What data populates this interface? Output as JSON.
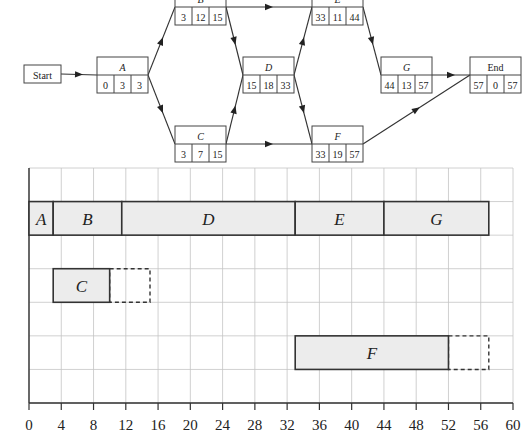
{
  "network": {
    "start_label": "Start",
    "nodes": [
      {
        "id": "A",
        "label": "A",
        "es": "0",
        "dur": "3",
        "ef": "3"
      },
      {
        "id": "B",
        "label": "B",
        "es": "3",
        "dur": "12",
        "ef": "15"
      },
      {
        "id": "C",
        "label": "C",
        "es": "3",
        "dur": "7",
        "ef": "15"
      },
      {
        "id": "D",
        "label": "D",
        "es": "15",
        "dur": "18",
        "ef": "33"
      },
      {
        "id": "E",
        "label": "E",
        "es": "33",
        "dur": "11",
        "ef": "44"
      },
      {
        "id": "F",
        "label": "F",
        "es": "33",
        "dur": "19",
        "ef": "57"
      },
      {
        "id": "G",
        "label": "G",
        "es": "44",
        "dur": "13",
        "ef": "57"
      },
      {
        "id": "End",
        "label": "End",
        "es": "57",
        "dur": "0",
        "ef": "57"
      }
    ],
    "edges": [
      [
        "Start",
        "A"
      ],
      [
        "A",
        "B"
      ],
      [
        "A",
        "C"
      ],
      [
        "B",
        "D"
      ],
      [
        "B",
        "E"
      ],
      [
        "C",
        "D"
      ],
      [
        "C",
        "F"
      ],
      [
        "D",
        "E"
      ],
      [
        "D",
        "F"
      ],
      [
        "E",
        "G"
      ],
      [
        "G",
        "End"
      ],
      [
        "F",
        "End"
      ]
    ]
  },
  "chart_data": {
    "type": "gantt",
    "title": "",
    "xlabel": "",
    "ylabel": "",
    "xlim": [
      0,
      60
    ],
    "x_ticks": [
      "0",
      "4",
      "8",
      "12",
      "16",
      "20",
      "24",
      "28",
      "32",
      "36",
      "40",
      "44",
      "48",
      "52",
      "56",
      "60"
    ],
    "grid": true,
    "rows": [
      {
        "row": 1,
        "bars": [
          {
            "label": "A",
            "start": 0,
            "end": 3
          },
          {
            "label": "B",
            "start": 3,
            "end": 11.5
          },
          {
            "label": "D",
            "start": 11.5,
            "end": 33
          },
          {
            "label": "E",
            "start": 33,
            "end": 44
          },
          {
            "label": "G",
            "start": 44,
            "end": 57
          }
        ]
      },
      {
        "row": 3,
        "bars": [
          {
            "label": "C",
            "start": 3,
            "end": 10,
            "slack_end": 15
          }
        ]
      },
      {
        "row": 5,
        "bars": [
          {
            "label": "F",
            "start": 33,
            "end": 52,
            "slack_end": 57
          }
        ]
      }
    ]
  }
}
